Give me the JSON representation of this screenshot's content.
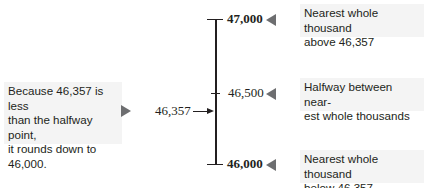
{
  "number_line": {
    "top_label": "47,000",
    "middle_label": "46,500",
    "bottom_label": "46,000",
    "pointer_label": "46,357"
  },
  "notes": {
    "left": [
      "Because 46,357 is less",
      "than the halfway point,",
      "it rounds down to",
      "46,000."
    ],
    "top": [
      "Nearest whole thousand",
      "above 46,357"
    ],
    "middle": [
      "Halfway between near-",
      "est whole thousands"
    ],
    "bottom": [
      "Nearest whole thousand",
      "below 46,357"
    ]
  },
  "colors": {
    "text": "#231f20",
    "note_background": "#f4f4f4",
    "marker": "#6d6e70"
  }
}
